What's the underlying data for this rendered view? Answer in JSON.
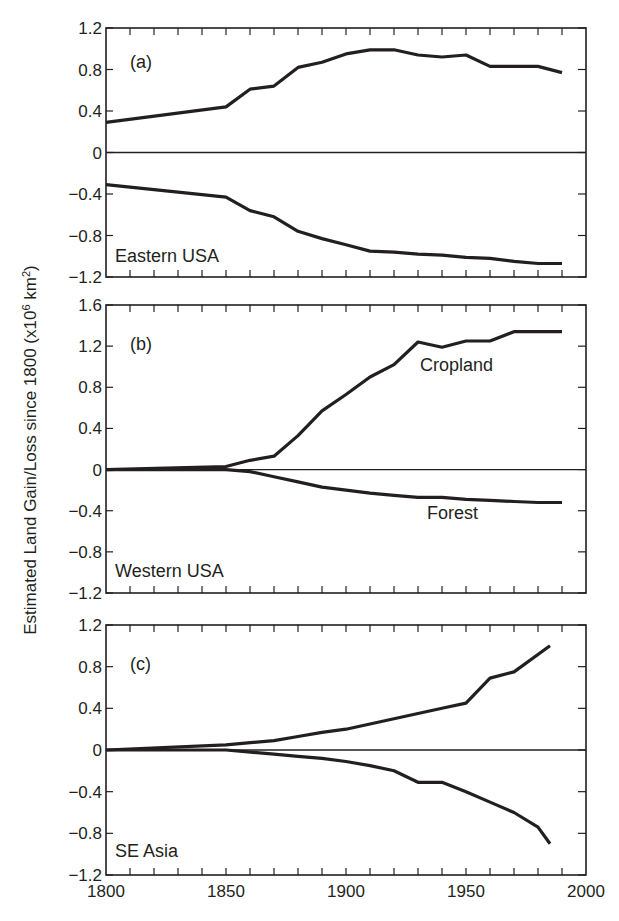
{
  "figure": {
    "ylabel": "Estimated Land Gain/Loss since 1800 (x10⁶ km²)",
    "ylabel_main": "Estimated Land Gain/Loss since 1800 (x10",
    "ylabel_sup1": "6",
    "ylabel_mid": " km",
    "ylabel_sup2": "2",
    "ylabel_end": ")",
    "line_color": "#231f20",
    "x_ticks": [
      1800,
      1850,
      1900,
      1950,
      2000
    ]
  },
  "chart_data": [
    {
      "type": "line",
      "panel": "(a)",
      "region": "Eastern USA",
      "xlabel": "",
      "ylabel": "Estimated Land Gain/Loss since 1800 (x10^6 km^2)",
      "xlim": [
        1800,
        2000
      ],
      "ylim": [
        -1.2,
        1.2
      ],
      "y_ticks": [
        1.2,
        0.8,
        0.4,
        0,
        -0.4,
        -0.8,
        -1.2
      ],
      "grid": false,
      "series": [
        {
          "name": "Cropland",
          "x": [
            1800,
            1850,
            1860,
            1870,
            1880,
            1890,
            1900,
            1910,
            1920,
            1930,
            1940,
            1950,
            1960,
            1970,
            1980,
            1990
          ],
          "values": [
            0.29,
            0.44,
            0.61,
            0.64,
            0.82,
            0.87,
            0.95,
            0.99,
            0.99,
            0.94,
            0.92,
            0.94,
            0.83,
            0.83,
            0.83,
            0.77
          ]
        },
        {
          "name": "Forest",
          "x": [
            1800,
            1850,
            1860,
            1870,
            1880,
            1890,
            1900,
            1910,
            1920,
            1930,
            1940,
            1950,
            1960,
            1970,
            1980,
            1990
          ],
          "values": [
            -0.31,
            -0.43,
            -0.56,
            -0.62,
            -0.76,
            -0.83,
            -0.89,
            -0.95,
            -0.96,
            -0.98,
            -0.99,
            -1.01,
            -1.02,
            -1.05,
            -1.07,
            -1.07
          ]
        }
      ]
    },
    {
      "type": "line",
      "panel": "(b)",
      "region": "Western USA",
      "xlabel": "",
      "ylabel": "Estimated Land Gain/Loss since 1800 (x10^6 km^2)",
      "xlim": [
        1800,
        2000
      ],
      "ylim": [
        -1.2,
        1.6
      ],
      "y_ticks": [
        1.6,
        1.2,
        0.8,
        0.4,
        0,
        -0.4,
        -0.8,
        -1.2
      ],
      "grid": false,
      "series_labels": {
        "cropland": "Cropland",
        "forest": "Forest"
      },
      "series": [
        {
          "name": "Cropland",
          "x": [
            1800,
            1850,
            1860,
            1870,
            1880,
            1890,
            1900,
            1910,
            1920,
            1930,
            1940,
            1950,
            1960,
            1970,
            1980,
            1990
          ],
          "values": [
            0,
            0.03,
            0.09,
            0.13,
            0.33,
            0.57,
            0.73,
            0.9,
            1.02,
            1.24,
            1.19,
            1.25,
            1.25,
            1.34,
            1.34,
            1.34
          ]
        },
        {
          "name": "Forest",
          "x": [
            1800,
            1850,
            1860,
            1870,
            1880,
            1890,
            1900,
            1910,
            1920,
            1930,
            1940,
            1950,
            1960,
            1970,
            1980,
            1990
          ],
          "values": [
            0,
            0,
            -0.02,
            -0.07,
            -0.12,
            -0.17,
            -0.2,
            -0.23,
            -0.25,
            -0.27,
            -0.27,
            -0.29,
            -0.3,
            -0.31,
            -0.32,
            -0.32
          ]
        }
      ]
    },
    {
      "type": "line",
      "panel": "(c)",
      "region": "SE Asia",
      "xlabel": "",
      "ylabel": "Estimated Land Gain/Loss since 1800 (x10^6 km^2)",
      "xlim": [
        1800,
        2000
      ],
      "ylim": [
        -1.2,
        1.2
      ],
      "y_ticks": [
        1.2,
        0.8,
        0.4,
        0,
        -0.4,
        -0.8,
        -1.2
      ],
      "x_ticks": [
        1800,
        1850,
        1900,
        1950,
        2000
      ],
      "grid": false,
      "series": [
        {
          "name": "Cropland",
          "x": [
            1800,
            1850,
            1870,
            1880,
            1890,
            1900,
            1910,
            1920,
            1930,
            1940,
            1950,
            1960,
            1970,
            1985
          ],
          "values": [
            0,
            0.05,
            0.09,
            0.13,
            0.17,
            0.2,
            0.25,
            0.3,
            0.35,
            0.4,
            0.45,
            0.69,
            0.75,
            1.0
          ]
        },
        {
          "name": "Forest",
          "x": [
            1800,
            1850,
            1870,
            1880,
            1890,
            1900,
            1910,
            1920,
            1930,
            1940,
            1950,
            1960,
            1970,
            1980,
            1985
          ],
          "values": [
            0,
            0,
            -0.04,
            -0.06,
            -0.08,
            -0.11,
            -0.15,
            -0.2,
            -0.31,
            -0.31,
            -0.4,
            -0.5,
            -0.6,
            -0.74,
            -0.9
          ]
        }
      ]
    }
  ]
}
